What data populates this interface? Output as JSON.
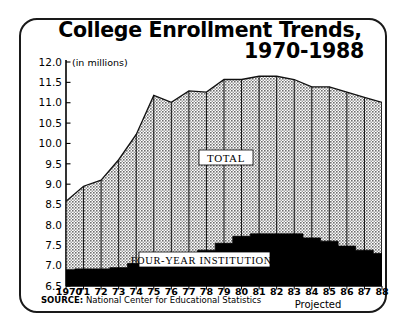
{
  "title": {
    "line1": "College Enrollment Trends,",
    "line2": "1970-1988"
  },
  "units_note": "(in millions)",
  "source": {
    "prefix": "SOURCE:",
    "text": " National Center for Educational Statistics"
  },
  "projected_label": "Projected",
  "series_labels": {
    "total": "TOTAL",
    "four_year": "FOUR-YEAR INSTITUTIONS"
  },
  "colors": {
    "ink": "#000000",
    "frame": "#1a1a1a",
    "total_fill": "#b3b3b3",
    "four_year_fill": "#000000",
    "background": "#ffffff"
  },
  "chart_data": {
    "type": "area",
    "title": "College Enrollment Trends, 1970-1988",
    "xlabel": "",
    "ylabel": "(in millions)",
    "ylim": [
      6.5,
      12.0
    ],
    "yticks": [
      6.5,
      7.0,
      7.5,
      8.0,
      8.5,
      9.0,
      9.5,
      10.0,
      10.5,
      11.0,
      11.5,
      12.0
    ],
    "ytick_labels": [
      "6.5",
      "7.0",
      "7.5",
      "8.0",
      "8.5",
      "9.0",
      "9.5",
      "10.0",
      "10.5",
      "11.0",
      "11.5",
      "12.0"
    ],
    "grid": false,
    "legend": "inline-labels",
    "x": [
      1970,
      1971,
      1972,
      1973,
      1974,
      1975,
      1976,
      1977,
      1978,
      1979,
      1980,
      1981,
      1982,
      1983,
      1984,
      1985,
      1986,
      1987,
      1988
    ],
    "categories": [
      "1970",
      "71",
      "72",
      "73",
      "74",
      "75",
      "76",
      "77",
      "78",
      "79",
      "80",
      "81",
      "82",
      "83",
      "84",
      "85",
      "86",
      "87",
      "88"
    ],
    "projected_from": "83",
    "series": [
      {
        "name": "TOTAL",
        "values": [
          8.58,
          8.95,
          9.1,
          9.6,
          10.22,
          11.18,
          11.01,
          11.29,
          11.26,
          11.57,
          11.57,
          11.65,
          11.65,
          11.57,
          11.39,
          11.39,
          11.26,
          11.13,
          11.01
        ]
      },
      {
        "name": "FOUR-YEAR INSTITUTIONS",
        "values": [
          6.9,
          6.92,
          6.92,
          6.95,
          7.05,
          7.22,
          7.22,
          7.3,
          7.38,
          7.55,
          7.72,
          7.78,
          7.78,
          7.78,
          7.68,
          7.6,
          7.48,
          7.38,
          7.3
        ]
      }
    ]
  }
}
